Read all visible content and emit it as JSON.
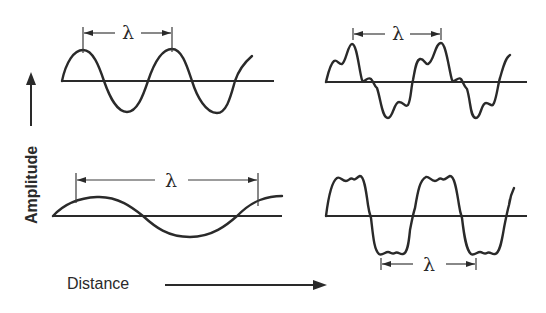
{
  "diagram": {
    "axes": {
      "y_label": "Amplitude",
      "x_label": "Distance"
    },
    "panels": [
      {
        "id": "top-left",
        "description": "sine wave, short wavelength",
        "wavelength_label": "λ"
      },
      {
        "id": "top-right",
        "description": "complex periodic wave with harmonics",
        "wavelength_label": "λ"
      },
      {
        "id": "bottom-left",
        "description": "sine wave, long wavelength",
        "wavelength_label": "λ"
      },
      {
        "id": "bottom-right",
        "description": "square-like wave with ripple",
        "wavelength_label": "λ"
      }
    ],
    "colors": {
      "ink": "#2a2a2a",
      "background": "#ffffff"
    }
  }
}
